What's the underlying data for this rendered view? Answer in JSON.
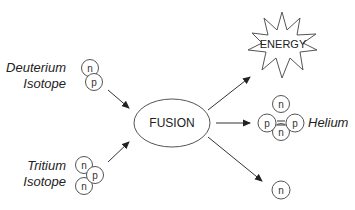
{
  "diagram": {
    "center": {
      "label": "FUSION"
    },
    "inputs": [
      {
        "label_line1": "Deuterium",
        "label_line2": "Isotope",
        "particles": [
          "n",
          "p"
        ]
      },
      {
        "label_line1": "Tritium",
        "label_line2": "Isotope",
        "particles": [
          "n",
          "p",
          "n"
        ]
      }
    ],
    "outputs": [
      {
        "label": "ENERGY",
        "shape": "starburst"
      },
      {
        "label": "Helium",
        "particles": [
          "n",
          "p",
          "p",
          "n"
        ]
      },
      {
        "label": "",
        "particles": [
          "n"
        ]
      }
    ],
    "colors": {
      "stroke": "#555555",
      "text": "#222222",
      "background": "#ffffff"
    }
  }
}
